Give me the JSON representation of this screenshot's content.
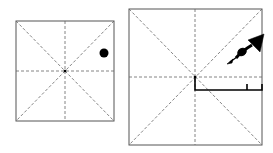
{
  "figure": {
    "colors": {
      "border": "#555555",
      "crease": "#666666",
      "ink": "#000000",
      "background": "#ffffff"
    },
    "left_panel": {
      "square": {
        "x": 16,
        "y": 21,
        "w": 98,
        "h": 100
      },
      "marker": {
        "type": "dot",
        "cx": 104,
        "cy": 53,
        "r": 4.5
      }
    },
    "right_panel": {
      "square": {
        "x": 129,
        "y": 9,
        "w": 133,
        "h": 136
      },
      "arrow": {
        "type": "fold-arrow",
        "from": [
          234,
          59
        ],
        "to": [
          264,
          37
        ]
      },
      "bracket": {
        "x1": 195,
        "x2": 262,
        "y": 90,
        "top": 77,
        "tick_x": 247,
        "tick_top": 84
      }
    }
  }
}
